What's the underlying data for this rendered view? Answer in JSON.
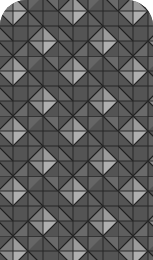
{
  "pattern": {
    "name": "geometric-diamond-tile",
    "colors": {
      "dark": "#525252",
      "mid": "#6f6f6f",
      "light": "#9a9a9a",
      "lighter": "#b0b0b0",
      "line": "#1e1e1e"
    },
    "cell_size": 15
  }
}
